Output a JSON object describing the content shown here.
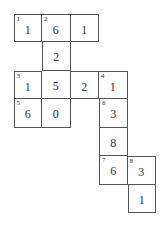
{
  "puzzle": {
    "cells": [
      {
        "r": 0,
        "c": 0,
        "num": "1",
        "val": "1"
      },
      {
        "r": 0,
        "c": 1,
        "num": "2",
        "val": "6"
      },
      {
        "r": 0,
        "c": 2,
        "num": "",
        "val": "1"
      },
      {
        "r": 1,
        "c": 1,
        "num": "",
        "val": "2"
      },
      {
        "r": 2,
        "c": 0,
        "num": "3",
        "val": "1"
      },
      {
        "r": 2,
        "c": 1,
        "num": "",
        "val": "5"
      },
      {
        "r": 2,
        "c": 2,
        "num": "",
        "val": "2"
      },
      {
        "r": 2,
        "c": 3,
        "num": "4",
        "val": "1"
      },
      {
        "r": 3,
        "c": 0,
        "num": "5",
        "val": "6"
      },
      {
        "r": 3,
        "c": 1,
        "num": "",
        "val": "0"
      },
      {
        "r": 3,
        "c": 3,
        "num": "6",
        "val": "3"
      },
      {
        "r": 4,
        "c": 3,
        "num": "",
        "val": "8"
      },
      {
        "r": 5,
        "c": 3,
        "num": "7",
        "val": "6"
      },
      {
        "r": 5,
        "c": 4,
        "num": "8",
        "val": "3"
      },
      {
        "r": 6,
        "c": 4,
        "num": "",
        "val": "1"
      }
    ]
  }
}
